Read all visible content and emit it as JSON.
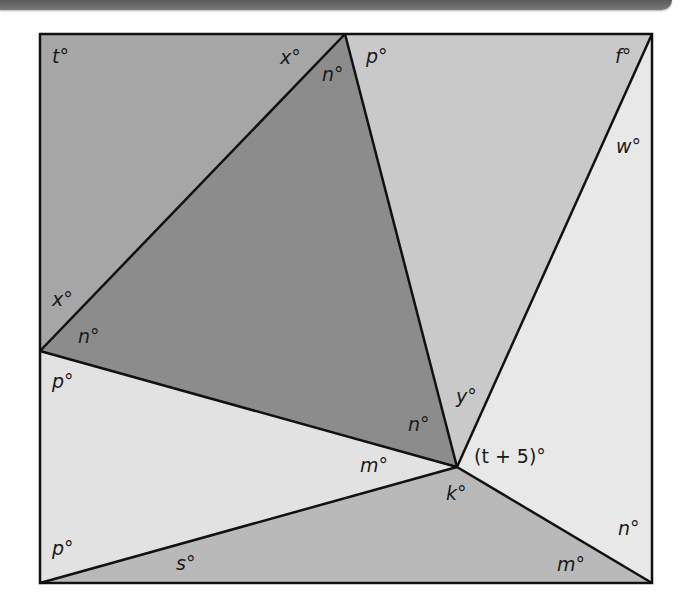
{
  "figure": {
    "colors": {
      "region_top_left": "#a6a6a6",
      "region_center_triangle": "#8c8c8c",
      "region_top_right": "#c9c9c9",
      "region_right": "#e8e8e8",
      "region_lower_left": "#e2e2e2",
      "region_bottom": "#b9b9b9",
      "stroke": "#111111",
      "header_bar": "#6a6a6a"
    },
    "vertices": {
      "top_left": [
        40,
        34
      ],
      "top_mid": [
        345,
        34
      ],
      "top_right": [
        652,
        34
      ],
      "left_mid": [
        40,
        351
      ],
      "center": [
        457,
        467
      ],
      "bottom_left": [
        40,
        583
      ],
      "bottom_right": [
        652,
        583
      ]
    },
    "labels": {
      "t": "t°",
      "x_top": "x°",
      "n_top": "n°",
      "p_top": "p°",
      "f": "f°",
      "w": "w°",
      "x_left": "x°",
      "n_left": "n°",
      "p_left": "p°",
      "y": "y°",
      "n_center": "n°",
      "t_plus_5": "(t + 5)°",
      "m_center": "m°",
      "k": "k°",
      "p_bottom": "p°",
      "s": "s°",
      "n_right": "n°",
      "m_right": "m°"
    }
  }
}
